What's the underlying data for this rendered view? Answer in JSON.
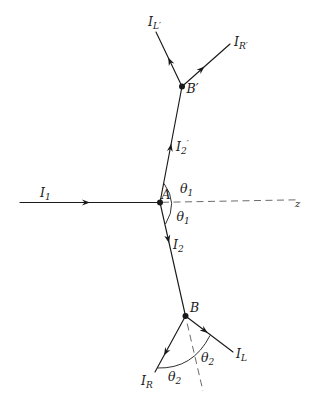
{
  "colors": {
    "line": "#1a1a1a",
    "dashed_line": "#6b6b6b",
    "background": "#ffffff"
  },
  "labels": {
    "incident_ray": {
      "base": "I",
      "sub": "1"
    },
    "internal_ray_up": {
      "base": "I",
      "sub": "2",
      "prime": "′"
    },
    "internal_ray_down": {
      "base": "I",
      "sub": "2"
    },
    "scattered_left_upper": {
      "base": "I",
      "sub": "L′"
    },
    "scattered_right_upper": {
      "base": "I",
      "sub": "R′"
    },
    "scattered_left_lower": {
      "base": "I",
      "sub": "L"
    },
    "scattered_right_lower": {
      "base": "I",
      "sub": "R"
    },
    "vertex_a": "A",
    "vertex_b": "B",
    "vertex_b_prime": "B′",
    "angle_theta1": {
      "base": "θ",
      "sub": "1"
    },
    "angle_theta2": {
      "base": "θ",
      "sub": "2"
    },
    "z_axis": "z"
  }
}
